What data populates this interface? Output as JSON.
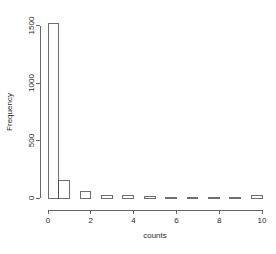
{
  "chart_data": {
    "type": "bar",
    "title": "",
    "subtitle": "",
    "xlabel": "counts",
    "ylabel": "Frequency",
    "xlim": [
      0,
      10
    ],
    "ylim": [
      0,
      1600
    ],
    "grid": false,
    "legend": null,
    "bin_width": 0.5,
    "x_ticks": [
      0,
      2,
      4,
      6,
      8,
      10
    ],
    "x_tick_labels": [
      "0",
      "2",
      "4",
      "6",
      "8",
      "10"
    ],
    "y_ticks": [
      0,
      500,
      1000,
      1500
    ],
    "y_tick_labels": [
      "0",
      "500",
      "1000",
      "1500"
    ],
    "bin_edges": [
      0,
      0.5,
      1,
      1.5,
      2,
      2.5,
      3,
      3.5,
      4,
      4.5,
      5,
      5.5,
      6,
      6.5,
      7,
      7.5,
      8,
      8.5,
      9,
      9.5,
      10
    ],
    "bin_starts": [
      0,
      0.5,
      1,
      1.5,
      2,
      2.5,
      3,
      3.5,
      4,
      4.5,
      5,
      5.5,
      6,
      6.5,
      7,
      7.5,
      8,
      8.5,
      9,
      9.5
    ],
    "values": [
      1520,
      150,
      0,
      55,
      0,
      22,
      0,
      20,
      0,
      12,
      0,
      8,
      0,
      7,
      0,
      6,
      0,
      6,
      0,
      22
    ],
    "categories": [
      "0-0.5",
      "0.5-1",
      "1-1.5",
      "1.5-2",
      "2-2.5",
      "2.5-3",
      "3-3.5",
      "3.5-4",
      "4-4.5",
      "4.5-5",
      "5-5.5",
      "5.5-6",
      "6-6.5",
      "6.5-7",
      "7-7.5",
      "7.5-8",
      "8-8.5",
      "8.5-9",
      "9-9.5",
      "9.5-10"
    ],
    "colors": {
      "bar_fill": "#ffffff",
      "bar_stroke": "#4a4a4a",
      "axis": "#555555",
      "text": "#2b2b2b",
      "background": "#ffffff"
    }
  }
}
